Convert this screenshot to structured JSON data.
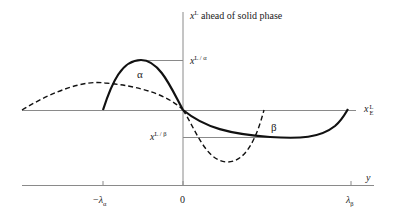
{
  "diagram": {
    "vertical_axis": {
      "label_var": "x",
      "label_sup": "L",
      "label_text": " ahead of solid phase"
    },
    "horizontal_axis": {
      "label": "y",
      "ticks": [
        {
          "label_prefix": "−",
          "label_var": "λ",
          "label_sub": "α"
        },
        {
          "label": "0"
        },
        {
          "label_var": "λ",
          "label_sub": "β"
        }
      ]
    },
    "reference_line": {
      "label_var": "x",
      "label_sup": "L",
      "label_sub": "E"
    },
    "levels": {
      "alpha": {
        "label_var": "x",
        "label_sup": "L / α"
      },
      "beta": {
        "label_var": "x",
        "label_sup": "L / β"
      }
    },
    "curve_labels": {
      "alpha": "α",
      "beta": "β"
    },
    "colors": {
      "axis": "#8a8a8a",
      "curve": "#111111",
      "text": "#222222"
    }
  }
}
